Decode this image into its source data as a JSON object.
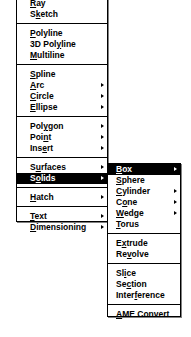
{
  "main_menu": {
    "groups": [
      {
        "items": [
          {
            "pre": "",
            "key": "R",
            "post": "ay",
            "submenu": false
          },
          {
            "pre": "S",
            "key": "k",
            "post": "etch",
            "submenu": false
          }
        ]
      },
      {
        "items": [
          {
            "pre": "",
            "key": "P",
            "post": "olyline",
            "submenu": false
          },
          {
            "pre": "3D Pol",
            "key": "y",
            "post": "line",
            "submenu": false
          },
          {
            "pre": "",
            "key": "M",
            "post": "ultiline",
            "submenu": false
          }
        ]
      },
      {
        "items": [
          {
            "pre": "",
            "key": "S",
            "post": "pline",
            "submenu": false
          },
          {
            "pre": "",
            "key": "A",
            "post": "rc",
            "submenu": true
          },
          {
            "pre": "",
            "key": "C",
            "post": "ircle",
            "submenu": true
          },
          {
            "pre": "",
            "key": "E",
            "post": "llipse",
            "submenu": true
          }
        ]
      },
      {
        "items": [
          {
            "pre": "Pol",
            "key": "y",
            "post": "gon",
            "submenu": true
          },
          {
            "pre": "Poi",
            "key": "n",
            "post": "t",
            "submenu": true
          },
          {
            "pre": "Ins",
            "key": "e",
            "post": "rt",
            "submenu": true
          }
        ]
      },
      {
        "items": [
          {
            "pre": "S",
            "key": "u",
            "post": "rfaces",
            "submenu": true
          },
          {
            "pre": "S",
            "key": "o",
            "post": "lids",
            "submenu": true,
            "selected": true
          }
        ]
      },
      {
        "items": [
          {
            "pre": "",
            "key": "H",
            "post": "atch",
            "submenu": true
          }
        ]
      },
      {
        "items": [
          {
            "pre": "",
            "key": "T",
            "post": "ext",
            "submenu": true
          },
          {
            "pre": "",
            "key": "D",
            "post": "imensioning",
            "submenu": true
          }
        ]
      }
    ]
  },
  "solids_submenu": {
    "groups": [
      {
        "items": [
          {
            "pre": "",
            "key": "B",
            "post": "ox",
            "submenu": true,
            "selected": true
          },
          {
            "pre": "",
            "key": "S",
            "post": "phere",
            "submenu": false
          },
          {
            "pre": "",
            "key": "C",
            "post": "ylinder",
            "submenu": true
          },
          {
            "pre": "C",
            "key": "o",
            "post": "ne",
            "submenu": true
          },
          {
            "pre": "",
            "key": "W",
            "post": "edge",
            "submenu": true
          },
          {
            "pre": "",
            "key": "T",
            "post": "orus",
            "submenu": false
          }
        ]
      },
      {
        "items": [
          {
            "pre": "E",
            "key": "x",
            "post": "trude",
            "submenu": false
          },
          {
            "pre": "Re",
            "key": "v",
            "post": "olve",
            "submenu": false
          }
        ]
      },
      {
        "items": [
          {
            "pre": "Sl",
            "key": "i",
            "post": "ce",
            "submenu": false
          },
          {
            "pre": "Se",
            "key": "c",
            "post": "tion",
            "submenu": false
          },
          {
            "pre": "Inter",
            "key": "f",
            "post": "erence",
            "submenu": false
          }
        ]
      },
      {
        "items": [
          {
            "pre": "",
            "key": "A",
            "post": "ME Convert",
            "submenu": false
          }
        ]
      }
    ]
  },
  "colors": {
    "highlight_bg": "#000000",
    "highlight_fg": "#ffffff",
    "menu_bg": "#ffffff"
  }
}
